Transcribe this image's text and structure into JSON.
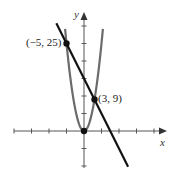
{
  "chart_data": {
    "type": "line",
    "title": "",
    "xlabel": "x",
    "ylabel": "y",
    "grid": false,
    "axis_tick_spacing": 5,
    "xlim": [
      -20,
      22
    ],
    "ylim": [
      -10,
      33
    ],
    "x_ticks": [
      -20,
      -15,
      -10,
      -5,
      0,
      5,
      10,
      15,
      20
    ],
    "y_ticks": [
      -10,
      -5,
      0,
      5,
      10,
      15,
      20,
      25,
      30
    ],
    "series": [
      {
        "name": "parabola",
        "equation": "y = x^2",
        "color": "#6b6b6b",
        "x_range": [
          -5.4,
          5.4
        ]
      },
      {
        "name": "line",
        "equation": "y = -2x + 15",
        "color": "#111111",
        "x_range": [
          -7.9,
          12.6
        ]
      }
    ],
    "points": [
      {
        "x": -5,
        "y": 25,
        "label": "(−5, 25)"
      },
      {
        "x": 3,
        "y": 9,
        "label": "(3, 9)"
      },
      {
        "x": 0,
        "y": 0,
        "label": ""
      }
    ]
  },
  "labels": {
    "x_axis": "x",
    "y_axis": "y",
    "point1": "(−5, 25)",
    "point2": "(3, 9)"
  }
}
